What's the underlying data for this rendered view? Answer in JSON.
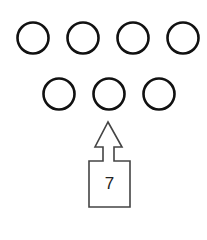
{
  "diagram": {
    "rows": [
      {
        "circles": [
          {
            "cx": 33,
            "cy": 38
          },
          {
            "cx": 83,
            "cy": 38
          },
          {
            "cx": 133,
            "cy": 38
          },
          {
            "cx": 183,
            "cy": 38
          }
        ]
      },
      {
        "circles": [
          {
            "cx": 59,
            "cy": 94
          },
          {
            "cx": 109,
            "cy": 94
          },
          {
            "cx": 159,
            "cy": 94
          }
        ]
      }
    ],
    "circle_radius": 15.5,
    "box_label": "7",
    "arrow_direction": "up",
    "stroke_color": "#111111"
  }
}
